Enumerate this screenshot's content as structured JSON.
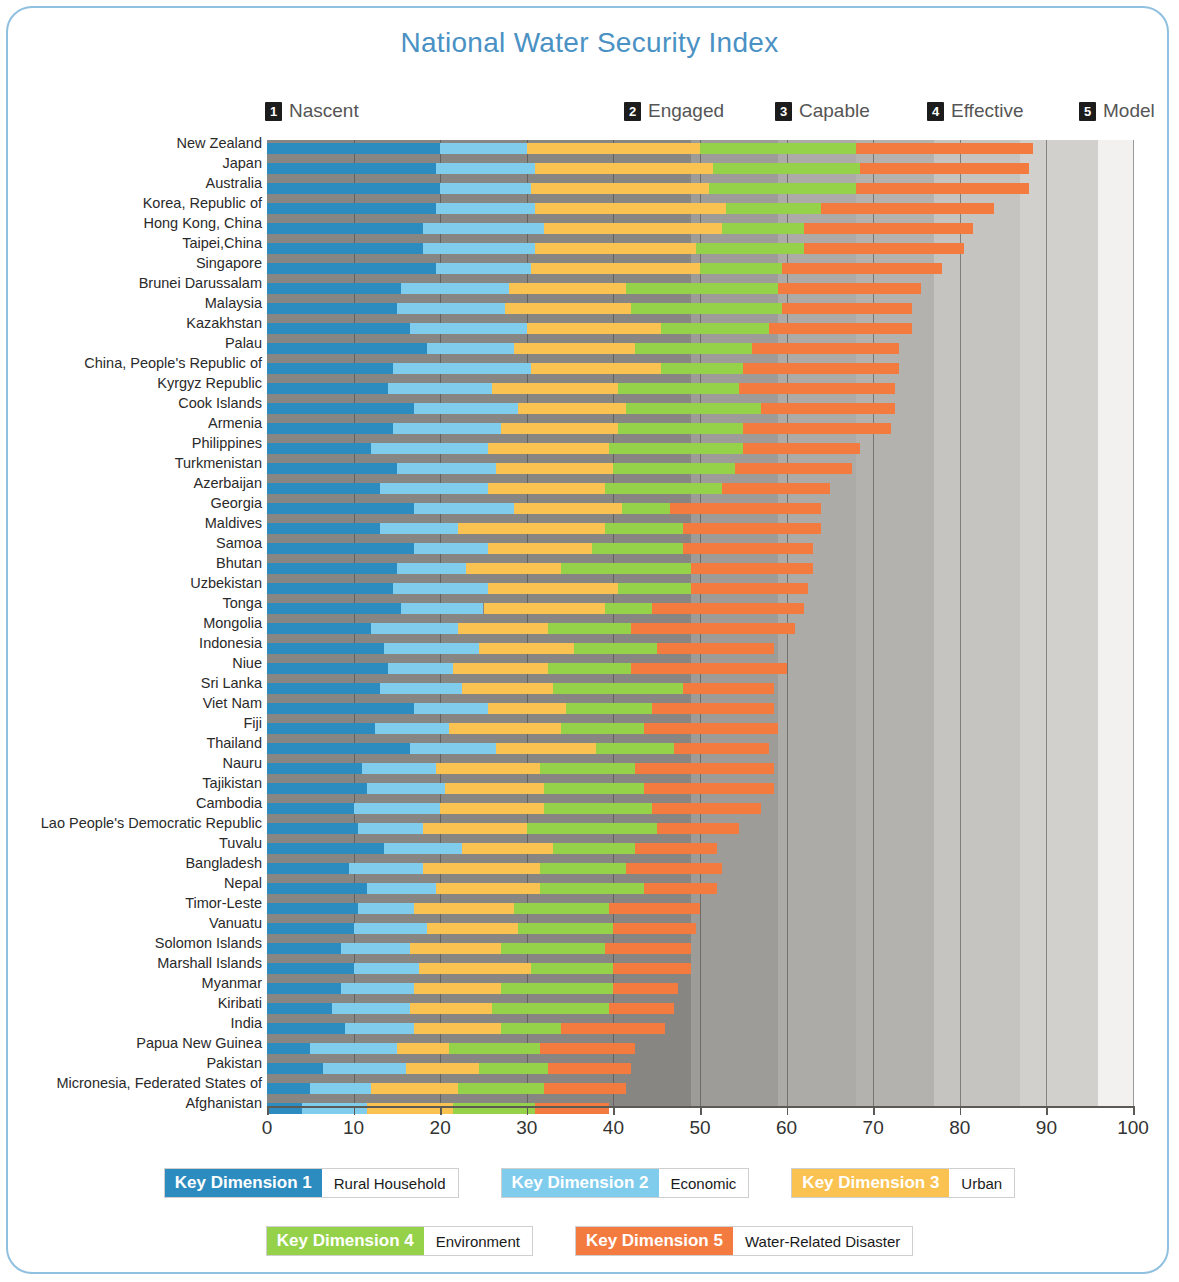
{
  "title": "National Water Security Index",
  "levels": [
    {
      "num": "1",
      "label": "Nascent",
      "x": 265
    },
    {
      "num": "2",
      "label": "Engaged",
      "x": 624
    },
    {
      "num": "3",
      "label": "Capable",
      "x": 775
    },
    {
      "num": "4",
      "label": "Effective",
      "x": 927
    },
    {
      "num": "5",
      "label": "Model",
      "x": 1079
    }
  ],
  "axis": {
    "ticks": [
      0,
      10,
      20,
      30,
      40,
      50,
      60,
      70,
      80,
      90,
      100
    ],
    "min": 0,
    "max": 100
  },
  "colors": {
    "kd1": "#2d8cbf",
    "kd2": "#7fcced",
    "kd3": "#f9c košice",
    "kd3_fix": "#f9c council",
    "dim1": "#2d8cbf",
    "dim2": "#7fcced",
    "dim3": "#fac250",
    "dim4": "#95d24a",
    "dim5": "#f47b3f",
    "title": "#4a91c4",
    "frame": "#8fc0e0"
  },
  "legend": [
    {
      "kd": "Key Dimension 1",
      "name": "Rural Household",
      "color": "#2d8cbf"
    },
    {
      "kd": "Key Dimension 2",
      "name": "Economic",
      "color": "#7fcced"
    },
    {
      "kd": "Key Dimension 3",
      "name": "Urban",
      "color": "#fac250"
    },
    {
      "kd": "Key Dimension 4",
      "name": "Environment",
      "color": "#95d24a"
    },
    {
      "kd": "Key Dimension 5",
      "name": "Water-Related Disaster",
      "color": "#f47b3f"
    }
  ],
  "chart_data": {
    "type": "bar",
    "title": "National Water Security Index",
    "subtype": "stacked-horizontal",
    "xlabel": "",
    "ylabel": "",
    "xlim": [
      0,
      100
    ],
    "grid": true,
    "legend_position": "bottom",
    "series": [
      {
        "name": "Key Dimension 1",
        "label": "Rural Household",
        "color": "#2d8cbf"
      },
      {
        "name": "Key Dimension 2",
        "label": "Economic",
        "color": "#7fcced"
      },
      {
        "name": "Key Dimension 3",
        "label": "Urban",
        "color": "#fac250"
      },
      {
        "name": "Key Dimension 4",
        "label": "Environment",
        "color": "#95d24a"
      },
      {
        "name": "Key Dimension 5",
        "label": "Water-Related Disaster",
        "color": "#f47b3f"
      }
    ],
    "categories": [
      "New Zealand",
      "Japan",
      "Australia",
      "Korea, Republic of",
      "Hong Kong, China",
      "Taipei,China",
      "Singapore",
      "Brunei Darussalam",
      "Malaysia",
      "Kazakhstan",
      "Palau",
      "China, People's Republic of",
      "Kyrgyz Republic",
      "Cook Islands",
      "Armenia",
      "Philippines",
      "Turkmenistan",
      "Azerbaijan",
      "Georgia",
      "Maldives",
      "Samoa",
      "Bhutan",
      "Uzbekistan",
      "Tonga",
      "Mongolia",
      "Indonesia",
      "Niue",
      "Sri Lanka",
      "Viet Nam",
      "Fiji",
      "Thailand",
      "Nauru",
      "Tajikistan",
      "Cambodia",
      "Lao People's Democratic Republic",
      "Tuvalu",
      "Bangladesh",
      "Nepal",
      "Timor-Leste",
      "Vanuatu",
      "Solomon Islands",
      "Marshall Islands",
      "Myanmar",
      "Kiribati",
      "India",
      "Papua New Guinea",
      "Pakistan",
      "Micronesia, Federated States of",
      "Afghanistan"
    ],
    "values": [
      [
        20.0,
        10.0,
        20.0,
        18.0,
        20.5
      ],
      [
        19.5,
        11.5,
        20.5,
        17.0,
        19.5
      ],
      [
        20.0,
        10.5,
        20.5,
        17.0,
        20.0
      ],
      [
        19.5,
        11.5,
        22.0,
        11.0,
        20.0
      ],
      [
        18.0,
        14.0,
        20.5,
        9.5,
        19.5
      ],
      [
        18.0,
        13.0,
        18.5,
        12.5,
        18.5
      ],
      [
        19.5,
        11.0,
        19.5,
        9.5,
        18.5
      ],
      [
        15.5,
        12.5,
        13.5,
        17.5,
        16.5
      ],
      [
        15.0,
        12.5,
        14.5,
        17.5,
        15.0
      ],
      [
        16.5,
        13.5,
        15.5,
        12.5,
        16.5
      ],
      [
        18.5,
        10.0,
        14.0,
        13.5,
        17.0
      ],
      [
        14.5,
        16.0,
        15.0,
        9.5,
        18.0
      ],
      [
        14.0,
        12.0,
        14.5,
        14.0,
        18.0
      ],
      [
        17.0,
        12.0,
        12.5,
        15.5,
        15.5
      ],
      [
        14.5,
        12.5,
        13.5,
        14.5,
        17.0
      ],
      [
        12.0,
        13.5,
        14.0,
        15.5,
        13.5
      ],
      [
        15.0,
        11.5,
        13.5,
        14.0,
        13.5
      ],
      [
        13.0,
        12.5,
        13.5,
        13.5,
        12.5
      ],
      [
        17.0,
        11.5,
        12.5,
        5.5,
        17.5
      ],
      [
        13.0,
        9.0,
        17.0,
        9.0,
        16.0
      ],
      [
        17.0,
        8.5,
        12.0,
        10.5,
        15.0
      ],
      [
        15.0,
        8.0,
        11.0,
        15.0,
        14.0
      ],
      [
        14.5,
        11.0,
        15.0,
        8.5,
        13.5
      ],
      [
        15.5,
        9.5,
        14.0,
        5.5,
        17.5
      ],
      [
        12.0,
        10.0,
        10.5,
        9.5,
        19.0
      ],
      [
        13.5,
        11.0,
        11.0,
        9.5,
        13.5
      ],
      [
        14.0,
        7.5,
        11.0,
        9.5,
        18.0
      ],
      [
        13.0,
        9.5,
        10.5,
        15.0,
        10.5
      ],
      [
        17.0,
        8.5,
        9.0,
        10.0,
        14.0
      ],
      [
        12.5,
        8.5,
        13.0,
        9.5,
        15.5
      ],
      [
        16.5,
        10.0,
        11.5,
        9.0,
        11.0
      ],
      [
        11.0,
        8.5,
        12.0,
        11.0,
        16.0
      ],
      [
        11.5,
        9.0,
        11.5,
        11.5,
        15.0
      ],
      [
        10.0,
        10.0,
        12.0,
        12.5,
        12.5
      ],
      [
        10.5,
        7.5,
        12.0,
        15.0,
        9.5
      ],
      [
        13.5,
        9.0,
        10.5,
        9.5,
        9.5
      ],
      [
        9.5,
        8.5,
        13.5,
        10.0,
        11.0
      ],
      [
        11.5,
        8.0,
        12.0,
        12.0,
        8.5
      ],
      [
        10.5,
        6.5,
        11.5,
        11.0,
        10.5
      ],
      [
        10.0,
        8.5,
        10.5,
        11.0,
        9.5
      ],
      [
        8.5,
        8.0,
        10.5,
        12.0,
        10.0
      ],
      [
        10.0,
        7.5,
        13.0,
        9.5,
        9.0
      ],
      [
        8.5,
        8.5,
        10.0,
        13.0,
        7.5
      ],
      [
        7.5,
        9.0,
        9.5,
        13.5,
        7.5
      ],
      [
        9.0,
        8.0,
        10.0,
        7.0,
        12.0
      ],
      [
        5.0,
        10.0,
        6.0,
        10.5,
        11.0
      ],
      [
        6.5,
        9.5,
        8.5,
        8.0,
        9.5
      ],
      [
        5.0,
        7.0,
        10.0,
        10.0,
        9.5
      ],
      [
        4.0,
        7.5,
        10.0,
        9.5,
        8.5
      ]
    ]
  }
}
